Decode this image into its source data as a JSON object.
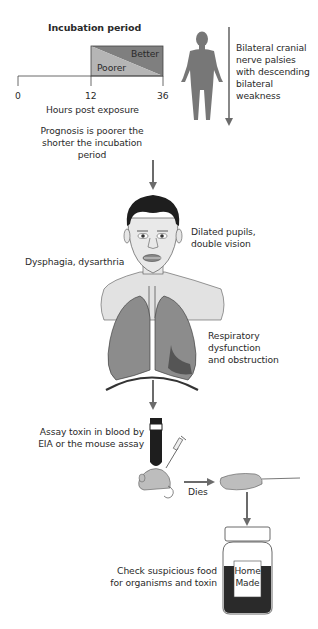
{
  "incubation": {
    "title": "Incubation period",
    "better_label": "Better",
    "poorer_label": "Poorer",
    "ticks": [
      "0",
      "12",
      "36"
    ],
    "axis_label": "Hours post exposure"
  },
  "prognosis_text": "Prognosis is poorer the shorter the incubation period",
  "body_figure": {
    "description": "Bilateral cranial nerve palsies with descending bilateral weakness",
    "lines": [
      "Bilateral cranial",
      "nerve palsies",
      "with descending",
      "bilateral",
      "weakness"
    ]
  },
  "head": {
    "right_label_lines": [
      "Dilated pupils,",
      "double vision"
    ],
    "left_label": "Dysphagia, dysarthria"
  },
  "lungs": {
    "label_lines": [
      "Respiratory",
      "dysfunction",
      "and obstruction"
    ]
  },
  "assay": {
    "label_lines": [
      "Assay toxin in blood by",
      "EIA or the mouse assay"
    ],
    "dies_label": "Dies"
  },
  "food": {
    "label_lines": [
      "Check suspicious food",
      "for organisms and toxin"
    ],
    "jar_label_lines": [
      "Home",
      "Made"
    ]
  },
  "colors": {
    "arrow": "#6b6b6b",
    "better": "#7f7f7f",
    "poorer": "#b5b5b5",
    "skin": "#e6e6e6",
    "lung": "#8c8c8c",
    "dark": "#1e1e1e"
  }
}
